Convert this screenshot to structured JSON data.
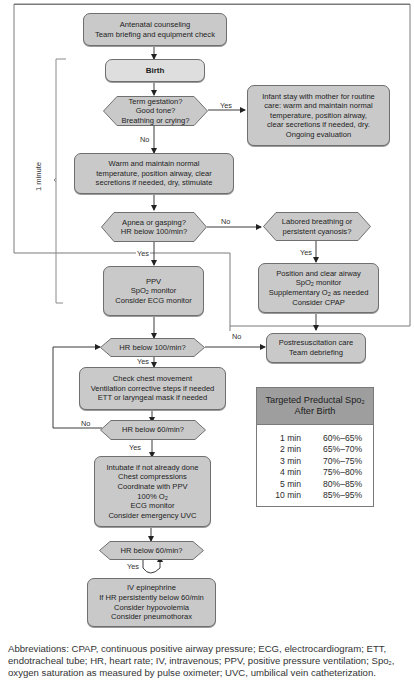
{
  "flowchart": {
    "time_bracket_label": "1 minute",
    "nodes": {
      "antenatal": [
        "Antenatal counseling",
        "Team briefing and equipment check"
      ],
      "birth": [
        "Birth"
      ],
      "term_question": [
        "Term gestation?",
        "Good tone?",
        "Breathing or crying?"
      ],
      "routine_care": [
        "Infant stay with mother for routine",
        "care: warm and maintain normal",
        "temperature, position airway,",
        "clear secretions if needed, dry.",
        "Ongoing evaluation"
      ],
      "warm": [
        "Warm and maintain normal",
        "temperature, position airway, clear",
        "secretions if needed, dry, stimulate"
      ],
      "apnea_question": [
        "Apnea or gasping?",
        "HR below 100/min?"
      ],
      "labored_question": [
        "Labored breathing or",
        "persistent cyanosis?"
      ],
      "ppv": {
        "line1": "PPV",
        "line2_pre": "SpO",
        "line2_sub": "2",
        "line2_post": " monitor",
        "line3": "Consider ECG monitor"
      },
      "position_airway": {
        "line1": "Position and clear airway",
        "line2_pre": "SpO",
        "line2_sub": "2",
        "line2_post": " monitor",
        "line3_pre": "Supplementary O",
        "line3_sub": "2",
        "line3_post": " as needed",
        "line4": "Consider CPAP"
      },
      "hr100_question": [
        "HR below 100/min?"
      ],
      "postresus": [
        "Postresuscitation care",
        "Team debriefing"
      ],
      "check_chest": [
        "Check chest movement",
        "Ventilation corrective steps if needed",
        "ETT or laryngeal mask if needed"
      ],
      "hr60_question_1": [
        "HR below 60/min?"
      ],
      "intubate": {
        "line1": "Intubate if not already done",
        "line2": "Chest compressions",
        "line3": "Coordinate with PPV",
        "line4_pre": "100% O",
        "line4_sub": "2",
        "line5": "ECG monitor",
        "line6": "Consider emergency UVC"
      },
      "hr60_question_2": [
        "HR below 60/min?"
      ],
      "epinephrine": [
        "IV epinephrine",
        "If HR persistently below 60/min",
        "Consider hypovolemia",
        "Consider pneumothorax"
      ]
    },
    "edge_labels": {
      "term_yes": "Yes",
      "term_no": "No",
      "apnea_no": "No",
      "apnea_yes": "Yes",
      "labored_yes": "Yes",
      "hr100_no": "No",
      "hr100_yes": "Yes",
      "hr60_1_no": "No",
      "hr60_1_yes": "Yes",
      "hr60_2_yes": "Yes"
    }
  },
  "spo2_table": {
    "title_pre": "Targeted Preductal Spo",
    "title_sub": "2",
    "title_line2": "After Birth",
    "rows": [
      {
        "time": "1 min",
        "range": "60%–65%"
      },
      {
        "time": "2 min",
        "range": "65%–70%"
      },
      {
        "time": "3 min",
        "range": "70%–75%"
      },
      {
        "time": "4 min",
        "range": "75%–80%"
      },
      {
        "time": "5 min",
        "range": "80%–85%"
      },
      {
        "time": "10 min",
        "range": "85%–95%"
      }
    ]
  },
  "abbreviations": {
    "part1": "Abbreviations: CPAP, continuous positive airway pressure; ECG, electrocardiogram; ETT, endotracheal tube; HR, heart rate; IV, intravenous; PPV, positive pressure ventilation; Spo",
    "sub": "2",
    "part2": ", oxygen saturation as measured by pulse oximeter; UVC, umbilical vein catheterization."
  },
  "colors": {
    "box_fill": "#c9c9c9",
    "box_fill_light": "#dedede",
    "table_header": "#9e9e9e",
    "line": "#3a3a3a"
  }
}
